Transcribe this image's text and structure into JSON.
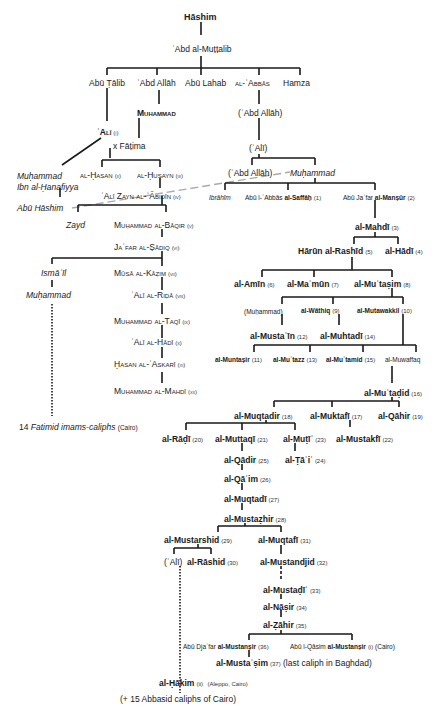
{
  "diagram": {
    "root": "Hāshim",
    "gen2": "ʿAbd al-Muṭṭalib",
    "gen3": [
      "Abū Ṭālib",
      "ʿAbd Allāh",
      "Abū Lahab",
      "al-ʿAbbās",
      "Hamza"
    ],
    "muhammad": "Muhammad",
    "abd_allah_paren": "(ʿAbd Allāh)",
    "ali_paren": "(ʿAlī)",
    "ali": {
      "name": "ʿAlī",
      "num": "(i)"
    },
    "fatima": "x Fāṭima",
    "ibn_hanafiyya": [
      "Muḥammad",
      "Ibn al-Ḥanafiyya"
    ],
    "abu_hashim": "Abū Hāshim",
    "hasan": {
      "name": "al-Ḥasan",
      "num": "(ii)"
    },
    "husayn": {
      "name": "al-Ḥusayn",
      "num": "(iii)"
    },
    "zayn": {
      "name": "ʿAlī Zayn al-ʿĀbidīn",
      "num": "(iv)"
    },
    "zayd": "Zayd",
    "baqir": {
      "name": "Muḥammad al-Bāqir",
      "num": "(v)"
    },
    "sadiq": {
      "name": "Jaʿfar al-Ṣādiq",
      "num": "(vi)"
    },
    "ismail": "Ismāʿīl",
    "ismaili_muhammad": "Muḥammad",
    "kazim": {
      "name": "Mūsā al-Kāẓim",
      "num": "(vii)"
    },
    "rida": {
      "name": "ʿAlī al-Riḍā",
      "num": "(viii)"
    },
    "taqi": {
      "name": "Muḥammad al-Taqī",
      "num": "(ix)"
    },
    "hadi_imam": {
      "name": "ʿAlī al-Hādī",
      "num": "(x)"
    },
    "askari": {
      "name": "Ḥasan al-ʿAskarī",
      "num": "(xi)"
    },
    "mahdi_imam": {
      "name": "Muḥammad al-Mahdī",
      "num": "(xii)"
    },
    "fatimids": {
      "pre": "14",
      "italic": "Fatimid imams-caliphs",
      "post": "(Cairo)"
    },
    "abd_allah_paren2": "(ʿAbd Allāh)",
    "abbasid_muhammad": "Muḥammad",
    "ibrahim": "Ibrāhīm",
    "saffah": {
      "pre": "Abū l-ʿAbbās",
      "name": "al-Saffāḥ",
      "num": "(1)"
    },
    "mansur": {
      "pre": "Abū Jaʿfar",
      "name": "al-Manṣūr",
      "num": "(2)"
    },
    "mahdi": {
      "name": "al-Mahdī",
      "num": "(3)"
    },
    "rashid": {
      "name": "Hārūn al-Rashīd",
      "num": "(5)"
    },
    "hadi": {
      "name": "al-Hādī",
      "num": "(4)"
    },
    "amin": {
      "name": "al-Amīn",
      "num": "(6)"
    },
    "mamun": {
      "name": "al-Maʾmūn",
      "num": "(7)"
    },
    "mutasim": {
      "name": "al-Muʿtaṣim",
      "num": "(8)"
    },
    "muhammad_paren": "(Muḥammad)",
    "wathiq": {
      "name": "al-Wāthiq",
      "num": "(9)"
    },
    "mutawakkil": {
      "name": "al-Mutawakkil",
      "num": "(10)"
    },
    "mustain": {
      "name": "al-Mustaʿīn",
      "num": "(12)"
    },
    "muhtadi": {
      "name": "al-Muhtadī",
      "num": "(14)"
    },
    "muntasir": {
      "name": "al-Muntaṣir",
      "num": "(11)"
    },
    "mutazz": {
      "name": "al-Muʿtazz",
      "num": "(13)"
    },
    "mutamid": {
      "name": "al-Muʿtamid",
      "num": "(15)"
    },
    "muwaffaq": "al-Muwaffaq",
    "mutadid": {
      "name": "al-Muʿtaḍid",
      "num": "(16)"
    },
    "muqtadir": {
      "name": "al-Muqtadir",
      "num": "(18)"
    },
    "muktafi": {
      "name": "al-Muktafī",
      "num": "(17)"
    },
    "qahir": {
      "name": "al-Qāhir",
      "num": "(19)"
    },
    "radi": {
      "name": "al-Rāḍī",
      "num": "(20)"
    },
    "muttaqi": {
      "name": "al-Muttaqī",
      "num": "(21)"
    },
    "muti": {
      "name": "al-Muṭīʿ",
      "num": "(23)"
    },
    "mustakfi": {
      "name": "al-Mustakfī",
      "num": "(22)"
    },
    "qadir": {
      "name": "al-Qādir",
      "num": "(25)"
    },
    "tai": {
      "name": "al-Ṭāʾiʿ",
      "num": "(24)"
    },
    "qaim": {
      "name": "al-Qāʾim",
      "num": "(26)"
    },
    "muqtadi": {
      "name": "al-Muqtadī",
      "num": "(27)"
    },
    "mustazhir": {
      "name": "al-Mustaẓhir",
      "num": "(28)"
    },
    "mustarshid": {
      "name": "al-Mustarshid",
      "num": "(29)"
    },
    "muqtafi": {
      "name": "al-Muqtafī",
      "num": "(31)"
    },
    "ali_paren2": "(ʿAlī)",
    "rashid2": {
      "name": "al-Rāshid",
      "num": "(30)"
    },
    "mustanjid": {
      "name": "al-Mustandjid",
      "num": "(32)"
    },
    "mustadi": {
      "name": "al-Mustaḍīʾ",
      "num": "(33)"
    },
    "nasir": {
      "name": "al-Nāṣir",
      "num": "(34)"
    },
    "zahir": {
      "name": "al-Ẓāhir",
      "num": "(35)"
    },
    "mustansir1": {
      "pre": "Abū Djaʿfar",
      "name": "al-Mustanṣir",
      "num": "(36)"
    },
    "mustansir2": {
      "pre": "Abū l-Qāsim",
      "name": "al-Mustanṣir",
      "num": "(i)",
      "post": "(Cairo)"
    },
    "mustasim": {
      "name": "al-Mustaʿṣim",
      "num": "(37)",
      "post": "(last caliph in Baghdad)"
    },
    "hakim": {
      "name": "al-Ḥākim",
      "num": "(ii)",
      "post": "(Aleppo, Cairo)"
    },
    "cairo_caliphs": "(+ 15 Abbasid caliphs of Cairo)"
  }
}
